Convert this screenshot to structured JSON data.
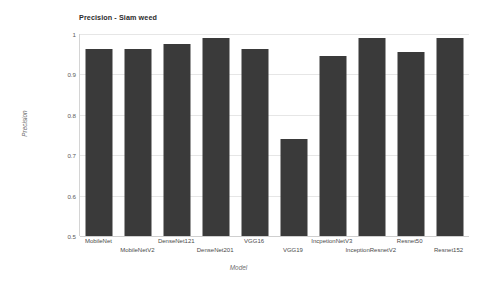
{
  "chart_data": {
    "type": "bar",
    "title": "Precision - Siam weed",
    "xlabel": "Model",
    "ylabel": "Precision",
    "ylim": [
      0.5,
      1.0
    ],
    "grid": true,
    "legend": "none",
    "ytick_labels": [
      "1",
      "0.9",
      "0.8",
      "0.7",
      "0.6",
      "0.5"
    ],
    "ytick_values": [
      1,
      0.9,
      0.8,
      0.7,
      0.6,
      0.5
    ],
    "categories": [
      "MobileNet",
      "MobileNetV2",
      "DenseNet121",
      "DenseNet201",
      "VGG16",
      "VGG19",
      "IncpetionNetV3",
      "InceptionResnetV2",
      "Resnet50",
      "Resnet152"
    ],
    "values": [
      0.963,
      0.963,
      0.975,
      0.99,
      0.962,
      0.74,
      0.945,
      0.99,
      0.955,
      0.99
    ],
    "bar_color": "#3a3a3a",
    "grid_color": "#e6e6e6",
    "background": "#ffffff"
  }
}
